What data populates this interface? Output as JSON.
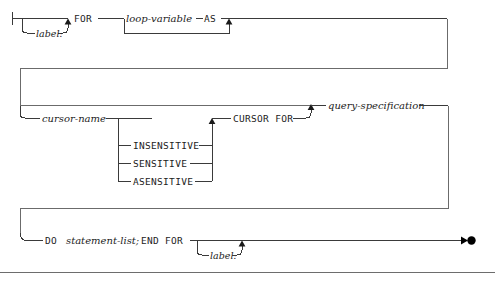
{
  "diagram": {
    "kind": "railroad-syntax-diagram",
    "line_color": "#3a3a3a",
    "text_color": "#1c1c1c",
    "divider_color": "#6d6d6d",
    "rows": [
      {
        "id": "row-1",
        "tokens": [
          {
            "id": "label-optional-1",
            "text": "label:",
            "style": "variable",
            "optional": true
          },
          {
            "id": "keyword-for",
            "text": "FOR",
            "style": "keyword",
            "optional": false
          },
          {
            "id": "loop-variable",
            "text": "loop-variable",
            "style": "variable",
            "optional": false
          },
          {
            "id": "keyword-as",
            "text": "AS",
            "style": "keyword",
            "optional": true
          }
        ]
      },
      {
        "id": "row-2",
        "tokens": [
          {
            "id": "cursor-name",
            "text": "cursor-name",
            "style": "variable",
            "optional": true
          },
          {
            "id": "sensitivity-insensitive",
            "text": "INSENSITIVE",
            "style": "keyword",
            "optional": true
          },
          {
            "id": "sensitivity-sensitive",
            "text": "SENSITIVE",
            "style": "keyword",
            "optional": true
          },
          {
            "id": "sensitivity-asensitive",
            "text": "ASENSITIVE",
            "style": "keyword",
            "optional": true
          },
          {
            "id": "keyword-cursor-for",
            "text": "CURSOR FOR",
            "style": "keyword",
            "optional": true
          },
          {
            "id": "query-specification",
            "text": "query-specification",
            "style": "variable",
            "optional": false
          }
        ]
      },
      {
        "id": "row-3",
        "tokens": [
          {
            "id": "keyword-do",
            "text": "DO",
            "style": "keyword",
            "optional": false
          },
          {
            "id": "statement-list",
            "text": "statement-list;",
            "style": "variable",
            "optional": false
          },
          {
            "id": "keyword-end-for",
            "text": "END FOR",
            "style": "keyword",
            "optional": false
          },
          {
            "id": "label-optional-2",
            "text": "label:",
            "style": "variable",
            "optional": true
          }
        ]
      }
    ],
    "text": {
      "label_1": "label:",
      "for": "FOR",
      "loop_variable": "loop-variable",
      "as": "AS",
      "cursor_name": "cursor-name",
      "insensitive": "INSENSITIVE",
      "sensitive": "SENSITIVE",
      "asensitive": "ASENSITIVE",
      "cursor_for": "CURSOR FOR",
      "query_specification": "query-specification",
      "do": "DO",
      "statement_list": "statement-list;",
      "end_for": "END FOR",
      "label_2": "label:"
    }
  }
}
